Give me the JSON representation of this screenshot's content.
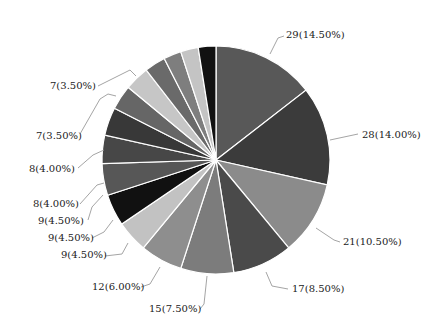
{
  "chart_data": {
    "type": "pie",
    "title": "",
    "start_angle_deg": 0,
    "direction": "clockwise",
    "total": 200,
    "slices": [
      {
        "value": 29,
        "label": "29(14.50%)",
        "color": "#585858"
      },
      {
        "value": 28,
        "label": "28(14.00%)",
        "color": "#3b3b3b"
      },
      {
        "value": 21,
        "label": "21(10.50%)",
        "color": "#8b8b8b"
      },
      {
        "value": 17,
        "label": "17(8.50%)",
        "color": "#4a4a4a"
      },
      {
        "value": 15,
        "label": "15(7.50%)",
        "color": "#7c7c7c"
      },
      {
        "value": 12,
        "label": "12(6.00%)",
        "color": "#8e8e8e"
      },
      {
        "value": 9,
        "label": "9(4.50%)",
        "color": "#c2c2c2"
      },
      {
        "value": 9,
        "label": "9(4.50%)",
        "color": "#111111"
      },
      {
        "value": 9,
        "label": "9(4.50%)",
        "color": "#575757"
      },
      {
        "value": 8,
        "label": "8(4.00%)",
        "color": "#474747"
      },
      {
        "value": 8,
        "label": "8(4.00%)",
        "color": "#383838"
      },
      {
        "value": 7,
        "label": "7(3.50%)",
        "color": "#666666"
      },
      {
        "value": 7,
        "label": "7(3.50%)",
        "color": "#c6c6c6"
      },
      {
        "value": 6,
        "label": "",
        "color": "#6a6a6a"
      },
      {
        "value": 5,
        "label": "",
        "color": "#7e7e7e"
      },
      {
        "value": 5,
        "label": "",
        "color": "#c4c4c4"
      },
      {
        "value": 5,
        "label": "",
        "color": "#111111"
      }
    ],
    "label_positions": [
      {
        "text": "29(14.50%)",
        "x": 286,
        "y": 38,
        "anchor": "start",
        "line": [
          [
            270,
            54
          ],
          [
            278,
            38
          ],
          [
            284,
            36
          ]
        ]
      },
      {
        "text": "28(14.00%)",
        "x": 362,
        "y": 138,
        "anchor": "start",
        "line": [
          [
            330,
            140
          ],
          [
            358,
            134
          ]
        ]
      },
      {
        "text": "21(10.50%)",
        "x": 343,
        "y": 245,
        "anchor": "start",
        "line": [
          [
            316,
            228
          ],
          [
            334,
            240
          ],
          [
            340,
            242
          ]
        ]
      },
      {
        "text": "17(8.50%)",
        "x": 292,
        "y": 292,
        "anchor": "start",
        "line": [
          [
            266,
            272
          ],
          [
            272,
            286
          ],
          [
            288,
            289
          ]
        ]
      },
      {
        "text": "15(7.50%)",
        "x": 149,
        "y": 312,
        "anchor": "start",
        "line": [
          [
            207,
            276
          ],
          [
            204,
            304
          ],
          [
            200,
            309
          ]
        ]
      },
      {
        "text": "12(6.00%)",
        "x": 92,
        "y": 290,
        "anchor": "start",
        "line": [
          [
            160,
            267
          ],
          [
            150,
            284
          ],
          [
            141,
            287
          ]
        ]
      },
      {
        "text": "9(4.50%)",
        "x": 61,
        "y": 258,
        "anchor": "start",
        "line": [
          [
            128,
            243
          ],
          [
            122,
            254
          ],
          [
            105,
            256
          ]
        ]
      },
      {
        "text": "9(4.50%)",
        "x": 48,
        "y": 241,
        "anchor": "start",
        "line": [
          [
            113,
            220
          ],
          [
            104,
            232
          ],
          [
            92,
            238
          ]
        ]
      },
      {
        "text": "9(4.50%)",
        "x": 38,
        "y": 224,
        "anchor": "start",
        "line": [
          [
            103,
            195
          ],
          [
            92,
            207
          ],
          [
            88,
            220
          ]
        ]
      },
      {
        "text": "8(4.00%)",
        "x": 33,
        "y": 207,
        "anchor": "start",
        "line": [
          [
            104,
            183
          ],
          [
            97,
            185
          ],
          [
            80,
            204
          ]
        ]
      },
      {
        "text": "8(4.00%)",
        "x": 29,
        "y": 172,
        "anchor": "start",
        "line": [
          [
            104,
            150
          ],
          [
            93,
            155
          ],
          [
            78,
            168
          ]
        ]
      },
      {
        "text": "7(3.50%)",
        "x": 36,
        "y": 139,
        "anchor": "start",
        "line": [
          [
            116,
            96
          ],
          [
            108,
            94
          ],
          [
            100,
            99
          ],
          [
            80,
            134
          ]
        ]
      },
      {
        "text": "7(3.50%)",
        "x": 50,
        "y": 89,
        "anchor": "start",
        "line": [
          [
            136,
            76
          ],
          [
            130,
            70
          ],
          [
            98,
            86
          ]
        ]
      }
    ],
    "center": [
      216,
      160
    ],
    "radius": 114,
    "legend": "none",
    "grid": false
  }
}
